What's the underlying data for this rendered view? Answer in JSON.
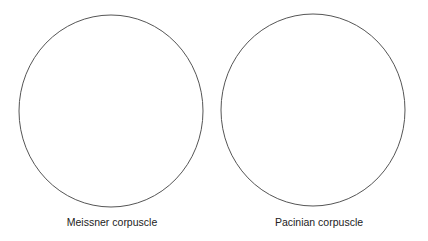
{
  "figure": {
    "panels": [
      {
        "label": "Meissner corpuscle",
        "shape": "circle-outline"
      },
      {
        "label": "Pacinian corpuscle",
        "shape": "circle-outline"
      }
    ],
    "stroke_color": "#555555",
    "background": "#ffffff"
  }
}
